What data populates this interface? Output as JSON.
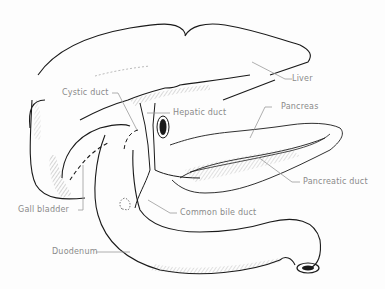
{
  "figure": {
    "labels": {
      "liver": "Liver",
      "cystic_duct": "Cystic duct",
      "hepatic_duct": "Hepatic duct",
      "pancreas": "Pancreas",
      "pancreatic_duct": "Pancreatic duct",
      "gall_bladder": "Gall bladder",
      "common_bile_duct": "Common bile duct",
      "duodenum": "Duodenum"
    },
    "colors": {
      "outline": "#1a1a1a",
      "label_text": "#8a8a8a",
      "leader_line": "#9a9a9a",
      "background": "#fdfdfd"
    }
  }
}
